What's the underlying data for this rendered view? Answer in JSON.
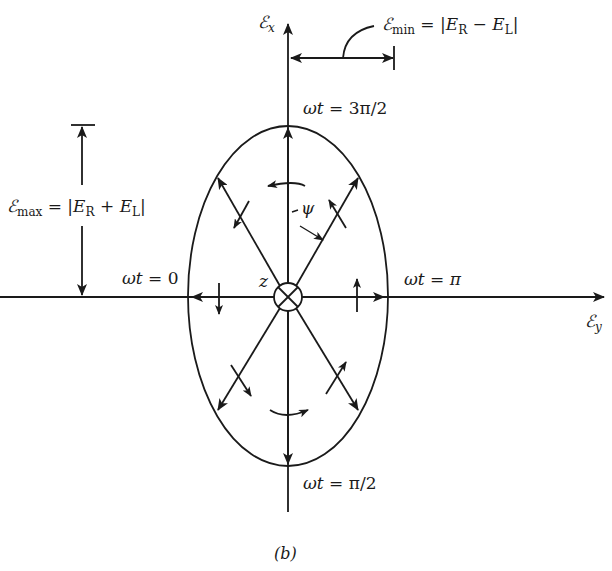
{
  "diagram": {
    "caption": "(b)",
    "axes": {
      "vertical_label_symbol": "ℰ",
      "vertical_label_sub": "x",
      "horizontal_label_symbol": "ℰ",
      "horizontal_label_sub": "y"
    },
    "center_label": "z",
    "angle_label": "ψ",
    "phase_labels": {
      "top_prefix": "ωt = ",
      "top_value": "3π/2",
      "left_prefix": "ωt = ",
      "left_value": "0",
      "right_prefix": "ωt = ",
      "right_value": "π",
      "bottom_prefix": "ωt = ",
      "bottom_value": "π/2"
    },
    "min_annotation": {
      "symbol": "ℰ",
      "sub": "min",
      "eq": " = |",
      "e1": "E",
      "e1_sub": "R",
      "op": " − ",
      "e2": "E",
      "e2_sub": "L",
      "close": "|"
    },
    "max_annotation": {
      "symbol": "ℰ",
      "sub": "max",
      "eq": " = |",
      "e1": "E",
      "e1_sub": "R",
      "op": " + ",
      "e2": "E",
      "e2_sub": "L",
      "close": "|"
    },
    "colors": {
      "stroke": "#1a1a1a",
      "background": "#ffffff"
    }
  }
}
